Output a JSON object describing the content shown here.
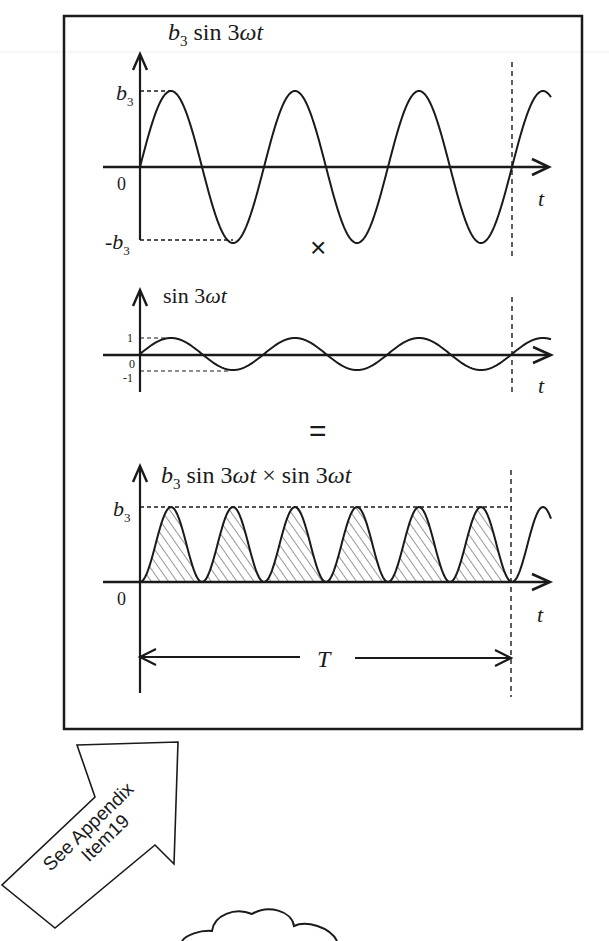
{
  "figure": {
    "frame": {
      "x": 63,
      "y": 15,
      "width": 520,
      "height": 715
    },
    "period_marker_x": 512,
    "stroke_color": "#1a1a1a",
    "background": "#ffffff"
  },
  "panels": [
    {
      "id": "top",
      "title_prefix": "b",
      "title_sub": "3",
      "title_rest": " sin 3",
      "title_omega": "ωt",
      "y_labels": {
        "pos_main": "b",
        "pos_sub": "3",
        "zero": "0",
        "neg_main": "-b",
        "neg_sub": "3"
      },
      "x_label": "t"
    },
    {
      "id": "middle",
      "title_rest": "sin 3",
      "title_omega": "ωt",
      "y_labels": {
        "pos": "1",
        "zero": "0",
        "neg": "-1"
      },
      "x_label": "t"
    },
    {
      "id": "bottom",
      "title_prefix": "b",
      "title_sub": "3",
      "title_rest": " sin 3",
      "title_omega": "ωt",
      "title_times": " × sin 3",
      "title_omega2": "ωt",
      "y_labels": {
        "pos_main": "b",
        "pos_sub": "3",
        "zero": "0"
      },
      "x_label": "t",
      "period_label": "T"
    }
  ],
  "operators": {
    "multiply": "×",
    "equals": "="
  },
  "callout": {
    "line1": "See Appendix",
    "line2": "Item19"
  },
  "chart_data": [
    {
      "type": "line",
      "title": "b3 sin 3ωt",
      "xlabel": "t",
      "ylabel": "",
      "y_ticks": [
        "b3",
        "0",
        "-b3"
      ],
      "function": "b3*sin(3*omega*t)",
      "cycles_in_T": 3,
      "ylim": [
        -1,
        1
      ],
      "x": [
        0,
        0.0833,
        0.1667,
        0.25,
        0.3333,
        0.4167,
        0.5,
        0.5833,
        0.6667,
        0.75,
        0.8333,
        0.9167,
        1.0
      ],
      "values": [
        0,
        1,
        0,
        -1,
        0,
        1,
        0,
        -1,
        0,
        1,
        0,
        -1,
        0
      ]
    },
    {
      "type": "line",
      "title": "sin 3ωt",
      "xlabel": "t",
      "y_ticks": [
        "1",
        "0",
        "-1"
      ],
      "function": "sin(3*omega*t)",
      "cycles_in_T": 3,
      "ylim": [
        -1,
        1
      ],
      "x": [
        0,
        0.0833,
        0.1667,
        0.25,
        0.3333,
        0.4167,
        0.5,
        0.5833,
        0.6667,
        0.75,
        0.8333,
        0.9167,
        1.0
      ],
      "values": [
        0,
        1,
        0,
        -1,
        0,
        1,
        0,
        -1,
        0,
        1,
        0,
        -1,
        0
      ]
    },
    {
      "type": "area",
      "title": "b3 sin 3ωt × sin 3ωt",
      "xlabel": "t",
      "y_ticks": [
        "b3",
        "0"
      ],
      "function": "b3*sin^2(3*omega*t)",
      "humps_in_T": 6,
      "fill": "hatched",
      "ylim": [
        0,
        1
      ],
      "x": [
        0,
        0.0833,
        0.1667,
        0.25,
        0.3333,
        0.4167,
        0.5,
        0.5833,
        0.6667,
        0.75,
        0.8333,
        0.9167,
        1.0
      ],
      "values": [
        0,
        1,
        0,
        1,
        0,
        1,
        0,
        1,
        0,
        1,
        0,
        1,
        0
      ],
      "annotation": "T spans one full period of the fundamental"
    }
  ]
}
